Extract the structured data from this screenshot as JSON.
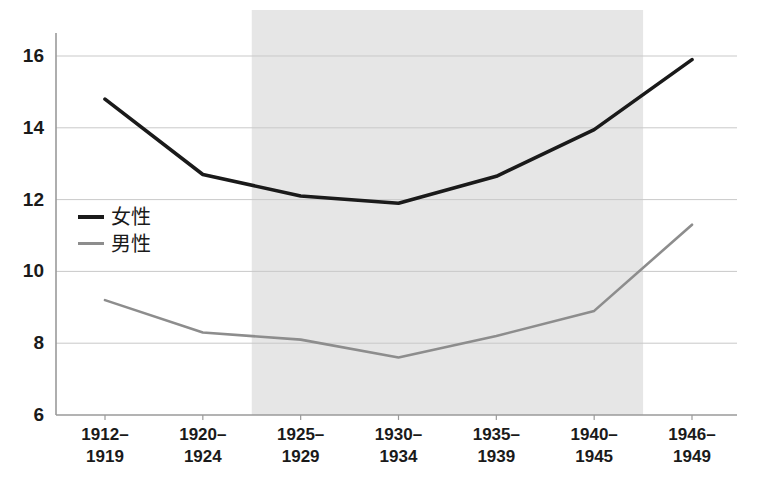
{
  "chart_data": {
    "type": "line",
    "title": "",
    "xlabel": "",
    "ylabel": "",
    "categories": [
      "1912–\n1919",
      "1920–\n1924",
      "1925–\n1929",
      "1930–\n1934",
      "1935–\n1939",
      "1940–\n1945",
      "1946–\n1949"
    ],
    "ylim": [
      6,
      16
    ],
    "yticks": [
      6,
      8,
      10,
      12,
      14,
      16
    ],
    "ytick_labels": [
      "6",
      "8",
      "10",
      "12",
      "14",
      "16"
    ],
    "grid": "horizontal",
    "legend_position": "inside-left",
    "series": [
      {
        "name": "女性",
        "color": "#1a1a1a",
        "values": [
          14.8,
          12.7,
          12.1,
          11.9,
          12.65,
          13.95,
          15.9
        ]
      },
      {
        "name": "男性",
        "color": "#8d8d8d",
        "values": [
          9.2,
          8.3,
          8.1,
          7.6,
          8.2,
          8.9,
          11.3
        ]
      }
    ],
    "shaded_band": {
      "from_category": "1925–1929",
      "to_category": "1940–1945",
      "color": "#e6e6e6"
    }
  },
  "axis": {
    "y_ticks": [
      {
        "label": "16",
        "value": 16
      },
      {
        "label": "14",
        "value": 14
      },
      {
        "label": "12",
        "value": 12
      },
      {
        "label": "10",
        "value": 10
      },
      {
        "label": "8",
        "value": 8
      },
      {
        "label": "6",
        "value": 6
      }
    ],
    "x_ticks": [
      {
        "line1": "1912–",
        "line2": "1919"
      },
      {
        "line1": "1920–",
        "line2": "1924"
      },
      {
        "line1": "1925–",
        "line2": "1929"
      },
      {
        "line1": "1930–",
        "line2": "1934"
      },
      {
        "line1": "1935–",
        "line2": "1939"
      },
      {
        "line1": "1940–",
        "line2": "1945"
      },
      {
        "line1": "1946–",
        "line2": "1949"
      }
    ]
  },
  "legend": {
    "items": [
      {
        "label": "女性",
        "color": "#1a1a1a"
      },
      {
        "label": "男性",
        "color": "#8d8d8d"
      }
    ]
  },
  "colors": {
    "female_line": "#1a1a1a",
    "male_line": "#8d8d8d",
    "gridline": "#c9c9c9",
    "axis": "#9a9a9a",
    "shade": "#e6e6e6",
    "background": "#ffffff"
  }
}
